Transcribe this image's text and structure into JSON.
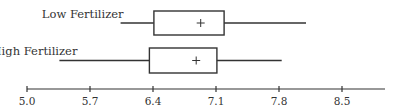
{
  "chart_data": {
    "type": "boxplot",
    "title": "",
    "xlabel": "",
    "ylabel": "",
    "orientation": "horizontal",
    "xlim": [
      5.0,
      8.9
    ],
    "ticks": [
      "5.0",
      "5.7",
      "6.4",
      "7.1",
      "7.8",
      "8.5"
    ],
    "tick_values": [
      5.0,
      5.7,
      6.4,
      7.1,
      7.8,
      8.5
    ],
    "grid": false,
    "legend": null,
    "series": [
      {
        "name": "Low Fertilizer",
        "min": 6.04,
        "q1": 6.41,
        "mean": 6.93,
        "q3": 7.19,
        "max": 8.1
      },
      {
        "name": "High Fertilizer",
        "min": 5.36,
        "q1": 6.36,
        "mean": 6.88,
        "q3": 7.11,
        "max": 7.83
      }
    ],
    "annotations": [
      "+ marks the mean"
    ]
  },
  "layout": {
    "axis_y": 89,
    "x0_px": 27,
    "px_per_unit": 90,
    "axis_end_px": 385,
    "line_color": "#333333"
  }
}
